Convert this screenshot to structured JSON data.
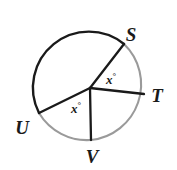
{
  "figure": {
    "type": "circle-with-central-angles",
    "background_color": "#ffffff",
    "stroke_color": "#1a1a1a",
    "arc_highlight_color": "#9a9a9a",
    "circle": {
      "center_x": 90,
      "center_y": 84,
      "radius": 56
    },
    "vertex_labels": [
      {
        "text": "S",
        "x": 131,
        "y": 34
      },
      {
        "text": "T",
        "x": 157,
        "y": 95
      },
      {
        "text": "U",
        "x": 22,
        "y": 127
      },
      {
        "text": "V",
        "x": 92,
        "y": 156
      }
    ],
    "angle_labels": [
      {
        "text": "x",
        "degree": "°",
        "x": 111,
        "y": 79
      },
      {
        "text": "x",
        "degree": "°",
        "x": 76,
        "y": 108
      }
    ],
    "radii": [
      {
        "name": "radius-to-s",
        "x1": 90,
        "y1": 88,
        "x2": 124,
        "y2": 44
      },
      {
        "name": "radius-to-t",
        "x1": 90,
        "y1": 88,
        "x2": 144,
        "y2": 94
      },
      {
        "name": "radius-to-u",
        "x1": 90,
        "y1": 88,
        "x2": 39,
        "y2": 113
      },
      {
        "name": "radius-to-v",
        "x1": 90,
        "y1": 88,
        "x2": 91,
        "y2": 140
      }
    ]
  }
}
